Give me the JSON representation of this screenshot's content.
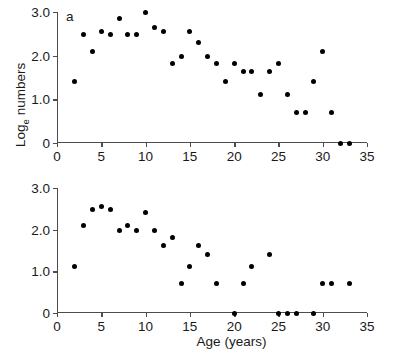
{
  "figure": {
    "ylabel_main": "Log",
    "ylabel_sub": "e",
    "ylabel_tail": " numbers",
    "xlabel": "Age (years)"
  },
  "panels": [
    {
      "tag": "a"
    },
    {
      "tag": "b"
    }
  ],
  "axes": {
    "x": {
      "min": 0,
      "max": 35,
      "ticks": [
        0,
        5,
        10,
        15,
        20,
        25,
        30,
        35
      ],
      "tick_labels": [
        "0",
        "5",
        "10",
        "15",
        "20",
        "25",
        "30",
        "35"
      ]
    },
    "y": {
      "min": 0,
      "max": 3.0,
      "ticks": [
        0,
        1.0,
        2.0,
        3.0
      ],
      "tick_labels": [
        "0",
        "1.0",
        "2.0",
        "3.0"
      ]
    }
  },
  "chart_data": [
    {
      "type": "scatter",
      "title": "a",
      "xlabel": "Age (years)",
      "ylabel": "Log_e numbers",
      "xlim": [
        0,
        35
      ],
      "ylim": [
        0,
        3.0
      ],
      "grid": false,
      "legend": null,
      "marker": "filled-circle",
      "color": "#000000",
      "x": [
        2,
        3,
        4,
        5,
        6,
        7,
        8,
        9,
        10,
        11,
        12,
        13,
        14,
        15,
        16,
        17,
        18,
        19,
        20,
        21,
        22,
        23,
        24,
        25,
        26,
        27,
        28,
        29,
        30,
        31,
        32,
        33
      ],
      "y": [
        1.4,
        2.48,
        2.09,
        2.56,
        2.48,
        2.84,
        2.48,
        2.48,
        3.0,
        2.64,
        2.56,
        1.81,
        1.97,
        2.56,
        2.31,
        1.97,
        1.81,
        1.4,
        1.81,
        1.64,
        1.64,
        1.11,
        1.64,
        1.81,
        1.11,
        0.7,
        0.7,
        1.4,
        2.09,
        0.7,
        0.0,
        0.0
      ]
    },
    {
      "type": "scatter",
      "title": "b",
      "xlabel": "Age (years)",
      "ylabel": "Log_e numbers",
      "xlim": [
        0,
        35
      ],
      "ylim": [
        0,
        3.0
      ],
      "grid": false,
      "legend": null,
      "marker": "filled-circle",
      "color": "#000000",
      "x": [
        2,
        3,
        4,
        5,
        6,
        7,
        8,
        9,
        10,
        11,
        12,
        13,
        14,
        15,
        16,
        17,
        18,
        20,
        21,
        22,
        24,
        25,
        26,
        27,
        29,
        30,
        31,
        33
      ],
      "y": [
        1.11,
        2.09,
        2.48,
        2.56,
        2.48,
        1.97,
        2.09,
        1.97,
        2.41,
        1.97,
        1.61,
        1.81,
        0.7,
        1.11,
        1.61,
        1.4,
        0.7,
        0.0,
        0.7,
        1.11,
        1.4,
        0.0,
        0.0,
        0.0,
        0.0,
        0.7,
        0.7,
        0.7
      ]
    }
  ]
}
